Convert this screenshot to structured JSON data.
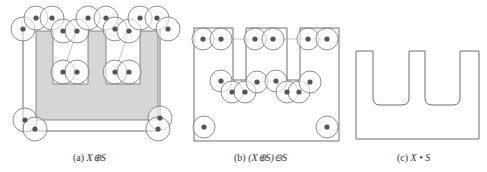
{
  "figure": {
    "colors": {
      "stroke": "#6e6e6e",
      "light_stroke": "#a8a8a8",
      "fill_shape": "#d6d6d6",
      "dot": "#555555",
      "circle_fill": "#ffffff",
      "background": "#ffffff"
    },
    "panels": [
      {
        "id": "a",
        "caption_prefix": "(a) ",
        "caption_expr": "X⊕S",
        "caption_x": 73,
        "shape_fill": "M36,31 L53,31 L53,84 L88,84 L88,31 L106,31 L106,84 L140,84 L140,31 L158,31 L158,120 L36,120 Z",
        "outline": "M23,30 L23,131 L160,131 L160,30",
        "circles": [
          [
            23,
            29
          ],
          [
            36,
            18
          ],
          [
            52,
            18
          ],
          [
            63,
            31
          ],
          [
            77,
            31
          ],
          [
            63,
            72
          ],
          [
            77,
            72
          ],
          [
            88,
            18
          ],
          [
            106,
            18
          ],
          [
            115,
            29
          ],
          [
            129,
            31
          ],
          [
            115,
            72
          ],
          [
            129,
            72
          ],
          [
            140,
            18
          ],
          [
            157,
            18
          ],
          [
            168,
            29
          ],
          [
            25,
            120
          ],
          [
            35,
            129
          ],
          [
            160,
            118
          ],
          [
            158,
            129
          ]
        ],
        "radius": 12
      },
      {
        "id": "b",
        "caption_prefix": "(b) ",
        "caption_expr": "(X⊕S)⊖S",
        "caption_x": 234,
        "outline": "M194,28 L233,28 L233,80 L246,80 L246,28 L287,28 L287,80 L300,80 L300,28 L339,28 L339,141 L194,141 Z",
        "circles": [
          [
            203,
            39
          ],
          [
            221,
            39
          ],
          [
            255,
            39
          ],
          [
            273,
            39
          ],
          [
            308,
            39
          ],
          [
            327,
            39
          ],
          [
            221,
            81
          ],
          [
            232,
            92
          ],
          [
            245,
            92
          ],
          [
            257,
            82
          ],
          [
            276,
            81
          ],
          [
            287,
            92
          ],
          [
            299,
            92
          ],
          [
            310,
            82
          ],
          [
            204,
            127
          ],
          [
            327,
            127
          ]
        ],
        "radius": 11
      },
      {
        "id": "c",
        "caption_prefix": "(c) ",
        "caption_expr": "X • S",
        "caption_x": 397,
        "outline": "M356,51 L373,51 L373,98 Q373,105 380,105 L402,105 Q409,105 409,98 L409,51 L425,51 L425,98 Q425,105 432,105 L453,105 Q460,105 460,98 L460,51 L479,51 L479,139 L356,139 Z"
      }
    ]
  }
}
